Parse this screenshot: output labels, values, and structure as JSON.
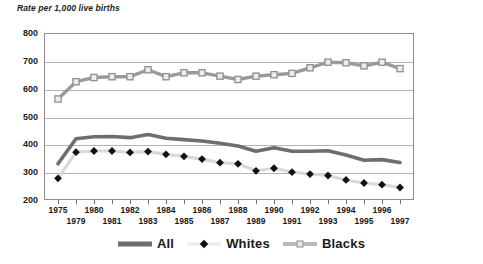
{
  "chart_data": {
    "type": "line",
    "title": "Rate per 1,000 live births",
    "xlabel": "",
    "ylabel": "Rate per 1,000 live births",
    "ylim": [
      200,
      800
    ],
    "ytick_step": 100,
    "yticks": [
      200,
      300,
      400,
      500,
      600,
      700,
      800
    ],
    "grid": true,
    "legend_position": "bottom",
    "categories": [
      "1975",
      "1979",
      "1980",
      "1981",
      "1982",
      "1983",
      "1984",
      "1985",
      "1986",
      "1987",
      "1988",
      "1989",
      "1990",
      "1991",
      "1992",
      "1993",
      "1994",
      "1995",
      "1996",
      "1997"
    ],
    "x_tick_labels_row0": [
      "1975",
      "",
      "1980",
      "",
      "1982",
      "",
      "1984",
      "",
      "1986",
      "",
      "1988",
      "",
      "1990",
      "",
      "1992",
      "",
      "1994",
      "",
      "1996",
      ""
    ],
    "x_tick_labels_row1": [
      "",
      "1979",
      "",
      "1981",
      "",
      "1983",
      "",
      "1985",
      "",
      "1987",
      "",
      "1989",
      "",
      "1991",
      "",
      "1993",
      "",
      "1995",
      "",
      "1997"
    ],
    "series": [
      {
        "name": "All",
        "color": "#6e6e6e",
        "marker": "none",
        "values": [
          330,
          420,
          427,
          428,
          424,
          435,
          422,
          417,
          412,
          404,
          394,
          375,
          388,
          375,
          375,
          377,
          362,
          343,
          345,
          335
        ]
      },
      {
        "name": "Whites",
        "color": "#d9d9d9",
        "marker_color": "#111111",
        "marker": "diamond",
        "values": [
          278,
          372,
          376,
          376,
          371,
          374,
          364,
          357,
          347,
          334,
          330,
          305,
          314,
          300,
          293,
          288,
          272,
          261,
          255,
          245
        ]
      },
      {
        "name": "Blacks",
        "color": "#9a9a9a",
        "marker_color": "#8f8f8f",
        "marker_fill": "#ececec",
        "marker": "square",
        "values": [
          563,
          625,
          640,
          643,
          643,
          668,
          643,
          657,
          657,
          645,
          633,
          645,
          650,
          655,
          675,
          695,
          693,
          682,
          695,
          672
        ]
      }
    ]
  },
  "legend": {
    "items": [
      {
        "label": "All",
        "swatch": "thick-gray-line"
      },
      {
        "label": "Whites",
        "swatch": "black-diamond-marker"
      },
      {
        "label": "Blacks",
        "swatch": "gray-line-square-marker"
      }
    ]
  },
  "colors": {
    "all_line": "#6e6e6e",
    "whites_line": "#d9d9d9",
    "whites_marker": "#111111",
    "blacks_line": "#9a9a9a",
    "blacks_marker_fill": "#ececec",
    "blacks_marker_stroke": "#8f8f8f",
    "gridline": "#b4b4b4",
    "axis": "#8d8d8d",
    "text": "#1a1a1a"
  }
}
